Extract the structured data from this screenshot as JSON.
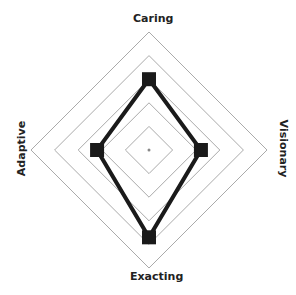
{
  "chart_data": {
    "type": "radar",
    "title": "",
    "axes": [
      "Caring",
      "Visionary",
      "Exacting",
      "Adaptive"
    ],
    "rings": 5,
    "range": [
      0,
      5
    ],
    "series": [
      {
        "name": "Profile",
        "values": [
          3,
          2.2,
          3.7,
          2.2
        ]
      }
    ],
    "grid": true,
    "legend": false
  },
  "labels": {
    "top": "Caring",
    "right": "Visionary",
    "bottom": "Exacting",
    "left": "Adaptive"
  },
  "colors": {
    "grid": "#aaaaaa",
    "series": "#1a1a1a"
  }
}
